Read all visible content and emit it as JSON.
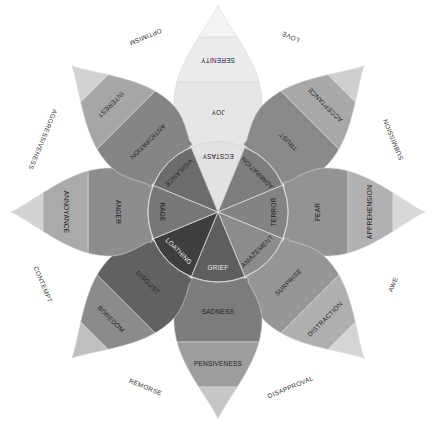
{
  "diagram": {
    "title": "",
    "center": {
      "x": 218,
      "y": 212
    },
    "radii": {
      "core": 70,
      "basic": 130,
      "mild": 175,
      "tip": 207
    },
    "petals": [
      {
        "id": "joy",
        "angle": -90,
        "intense": "ECSTASY",
        "basic": "JOY",
        "mild": "SERENITY",
        "colors": {
          "core": "#e2e2e2",
          "basic": "#e6e6e6",
          "mild": "#ebebeb",
          "tip": "#f3f3f3"
        }
      },
      {
        "id": "trust",
        "angle": -45,
        "intense": "ADMIRATION",
        "basic": "TRUST",
        "mild": "ACCEPTANCE",
        "colors": {
          "core": "#7d7d7d",
          "basic": "#8a8a8a",
          "mild": "#a8a8a8",
          "tip": "#cfcfcf"
        }
      },
      {
        "id": "fear",
        "angle": 0,
        "intense": "TERROR",
        "basic": "FEAR",
        "mild": "APPREHENSION",
        "colors": {
          "core": "#838383",
          "basic": "#939393",
          "mild": "#b1b1b1",
          "tip": "#d8d8d8"
        }
      },
      {
        "id": "surprise",
        "angle": 45,
        "intense": "AMAZEMENT",
        "basic": "SURPRISE",
        "mild": "DISTRACTION",
        "colors": {
          "core": "#8c8c8c",
          "basic": "#969696",
          "mild": "#afafaf",
          "tip": "#d4d4d4"
        }
      },
      {
        "id": "sadness",
        "angle": 90,
        "intense": "GRIEF",
        "basic": "SADNESS",
        "mild": "PENSIVENESS",
        "colors": {
          "core": "#5e5e5e",
          "basic": "#7c7c7c",
          "mild": "#9d9d9d",
          "tip": "#c6c6c6"
        }
      },
      {
        "id": "disgust",
        "angle": 135,
        "intense": "LOATHING",
        "basic": "DISGUST",
        "mild": "BOREDOM",
        "colors": {
          "core": "#3e3e3e",
          "basic": "#616161",
          "mild": "#8b8b8b",
          "tip": "#bfbfbf"
        }
      },
      {
        "id": "anger",
        "angle": 180,
        "intense": "RAGE",
        "basic": "ANGER",
        "mild": "ANNOYANCE",
        "colors": {
          "core": "#777777",
          "basic": "#8d8d8d",
          "mild": "#aaaaaa",
          "tip": "#d3d3d3"
        }
      },
      {
        "id": "anticipation",
        "angle": -135,
        "intense": "VIGILANCE",
        "basic": "ANTICIPATION",
        "mild": "INTEREST",
        "colors": {
          "core": "#6c6c6c",
          "basic": "#858585",
          "mild": "#a6a6a6",
          "tip": "#d2d2d2"
        }
      }
    ],
    "dyads": [
      {
        "label": "LOVE",
        "angle": -67.5
      },
      {
        "label": "SUBMISSION",
        "angle": -22.5
      },
      {
        "label": "AWE",
        "angle": 22.5
      },
      {
        "label": "DISAPPROVAL",
        "angle": 67.5
      },
      {
        "label": "REMORSE",
        "angle": 112.5
      },
      {
        "label": "CONTEMPT",
        "angle": 157.5
      },
      {
        "label": "AGGRESSIVENESS",
        "angle": -157.5
      },
      {
        "label": "OPTIMISM",
        "angle": -112.5
      }
    ],
    "dyad_radius": 190,
    "separator_color": "#d9d9d9"
  }
}
